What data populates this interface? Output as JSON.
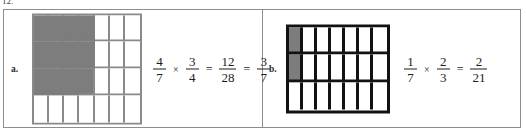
{
  "problem": {
    "number": "12."
  },
  "colors": {
    "shade": "#7d7d7d",
    "grid_a_line": "#8a8a8a",
    "grid_b_line": "#121212",
    "box_border": "#8d8d8d",
    "text": "#1c1c1c"
  },
  "panels": [
    {
      "label": "a.",
      "grid": {
        "columns": 7,
        "rows": 4,
        "shaded_columns": 4,
        "shaded_rows": 3,
        "line_style": "thin-gray"
      },
      "equation": {
        "factor1": {
          "numerator": "4",
          "denominator": "7"
        },
        "operator": "×",
        "factor2": {
          "numerator": "3",
          "denominator": "4"
        },
        "equals1": "=",
        "product": {
          "numerator": "12",
          "denominator": "28"
        },
        "equals2": "=",
        "simplified": {
          "numerator": "3",
          "denominator": "7"
        }
      }
    },
    {
      "label": "b.",
      "grid": {
        "columns": 7,
        "rows": 3,
        "shaded_columns": 1,
        "shaded_rows": 2,
        "line_style": "thick-black"
      },
      "equation": {
        "factor1": {
          "numerator": "1",
          "denominator": "7"
        },
        "operator": "×",
        "factor2": {
          "numerator": "2",
          "denominator": "3"
        },
        "equals1": "=",
        "product": {
          "numerator": "2",
          "denominator": "21"
        },
        "equals2": null,
        "simplified": null
      }
    }
  ]
}
